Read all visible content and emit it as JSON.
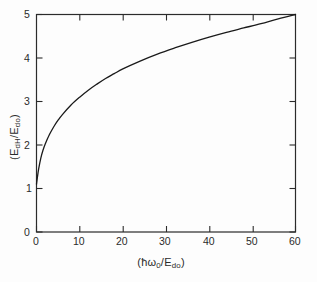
{
  "figure": {
    "background_color": "#fdfdfd",
    "ink_color": "#2b2b2b"
  },
  "axes": {
    "x_label_parts": {
      "open": "(",
      "hbar": "ħ",
      "omega": "ω",
      "omega_sub": "0",
      "slash": "/",
      "E": "E",
      "E_sub": "do",
      "close": ")"
    },
    "y_label_parts": {
      "open": "(",
      "E1": "E",
      "E1_sub": "dH",
      "slash": "/",
      "E2": "E",
      "E2_sub": "do",
      "close": ")"
    },
    "x_label_text": "(ħω₀/Eₑₒ)",
    "y_label_text": "(Eₑₕ/Eₑₒ)",
    "x_ticks": [
      "0",
      "10",
      "20",
      "30",
      "40",
      "50",
      "60"
    ],
    "y_ticks": [
      "0",
      "1",
      "2",
      "3",
      "4",
      "5"
    ]
  },
  "chart_data": {
    "type": "line",
    "title": "",
    "subtitle": "",
    "xlabel": "(ħω₀/Eₑₒ)",
    "ylabel": "(Eₑₕ/Eₑₒ)",
    "xlim": [
      0,
      60
    ],
    "ylim": [
      0,
      5
    ],
    "xticks": [
      0,
      10,
      20,
      30,
      40,
      50,
      60
    ],
    "yticks": [
      0,
      1,
      2,
      3,
      4,
      5
    ],
    "grid": false,
    "legend": null,
    "annotations": [],
    "series": [
      {
        "name": "E_dH/E_do",
        "x": [
          0.0,
          0.2,
          0.5,
          1.0,
          1.5,
          2.0,
          3.0,
          4.0,
          5.0,
          6.0,
          8.0,
          10.0,
          12.0,
          14.0,
          16.0,
          18.0,
          20.0,
          24.0,
          28.0,
          32.0,
          36.0,
          40.0,
          44.0,
          48.0,
          52.0,
          56.0,
          60.0
        ],
        "y": [
          1.1,
          1.25,
          1.45,
          1.7,
          1.88,
          2.02,
          2.24,
          2.42,
          2.57,
          2.7,
          2.92,
          3.1,
          3.26,
          3.4,
          3.53,
          3.64,
          3.75,
          3.93,
          4.09,
          4.23,
          4.36,
          4.48,
          4.59,
          4.69,
          4.79,
          4.9,
          5.0
        ]
      }
    ]
  }
}
